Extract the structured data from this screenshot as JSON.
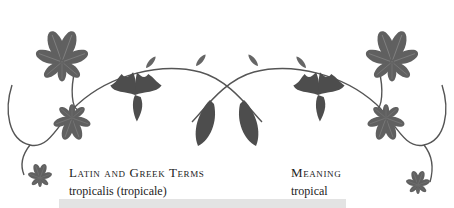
{
  "table": {
    "headers": {
      "latin": "Latin and Greek Terms",
      "meaning": "Meaning"
    },
    "rows": [
      {
        "latin": "tropicalis (tropicale)",
        "meaning": "tropical"
      }
    ],
    "highlighted_row_partial": ""
  },
  "colors": {
    "leaf": "#5f5f5f",
    "leaf_dark": "#4a4a4a",
    "stem": "#555555",
    "highlight_row": "#e3e3e3",
    "text": "#222222"
  },
  "ornament": {
    "icon": "horse-chestnut-leaf-vine-icon"
  }
}
